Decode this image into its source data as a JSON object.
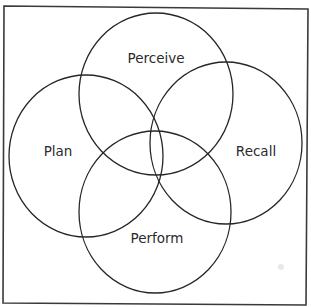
{
  "diagram": {
    "type": "four-set-venn",
    "sets": [
      {
        "id": "perceive",
        "label": "Perceive",
        "position": "top"
      },
      {
        "id": "plan",
        "label": "Plan",
        "position": "left"
      },
      {
        "id": "recall",
        "label": "Recall",
        "position": "right"
      },
      {
        "id": "perform",
        "label": "Perform",
        "position": "bottom"
      }
    ],
    "colors": {
      "stroke": "#262626",
      "frame": "#3a3a3a",
      "text": "#2b2b2b",
      "background": "#ffffff"
    }
  }
}
